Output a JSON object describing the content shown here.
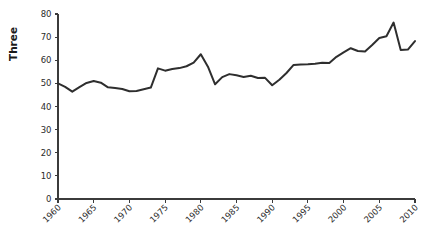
{
  "chart_data": {
    "type": "line",
    "title": "",
    "xlabel": "",
    "ylabel": "Three",
    "xlim": [
      1960,
      2010
    ],
    "ylim": [
      0,
      80
    ],
    "grid": false,
    "legend": null,
    "xticks": [
      "1960",
      "1965",
      "1970",
      "1975",
      "1980",
      "1985",
      "1990",
      "1995",
      "2000",
      "2005",
      "2010"
    ],
    "yticks": [
      "0",
      "10",
      "20",
      "30",
      "40",
      "50",
      "60",
      "70",
      "80"
    ],
    "series": [
      {
        "name": "Three",
        "color": "#2e2e2e",
        "x": [
          1960,
          1961,
          1962,
          1963,
          1964,
          1965,
          1966,
          1967,
          1968,
          1969,
          1970,
          1971,
          1972,
          1973,
          1974,
          1975,
          1976,
          1977,
          1978,
          1979,
          1980,
          1981,
          1982,
          1983,
          1984,
          1985,
          1986,
          1987,
          1988,
          1989,
          1990,
          1991,
          1992,
          1993,
          1994,
          1995,
          1996,
          1997,
          1998,
          1999,
          2000,
          2001,
          2002,
          2003,
          2004,
          2005,
          2006,
          2007,
          2008,
          2009,
          2010
        ],
        "values": [
          50.0,
          48.5,
          46.4,
          48.4,
          50.2,
          51.0,
          50.3,
          48.3,
          48.0,
          47.6,
          46.6,
          46.7,
          47.5,
          48.2,
          56.5,
          55.5,
          56.2,
          56.6,
          57.4,
          59.0,
          62.6,
          57.2,
          49.6,
          52.7,
          54.0,
          53.5,
          52.8,
          53.3,
          52.3,
          52.4,
          49.2,
          51.6,
          54.5,
          58.0,
          58.2,
          58.3,
          58.5,
          58.9,
          58.8,
          61.5,
          63.4,
          65.2,
          64.0,
          63.8,
          66.6,
          69.6,
          70.4,
          76.3,
          64.4,
          64.6,
          68.3
        ]
      }
    ]
  }
}
